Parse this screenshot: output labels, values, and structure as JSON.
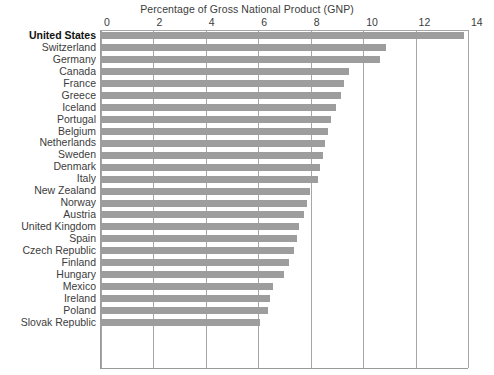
{
  "chart_data": {
    "type": "bar",
    "orientation": "horizontal",
    "title": "Percentage of Gross National Product (GNP)",
    "xlabel": "Percentage of Gross National Product (GNP)",
    "ylabel": "",
    "xlim": [
      0,
      14
    ],
    "xticks": [
      0,
      2,
      4,
      6,
      8,
      10,
      12,
      14
    ],
    "tick_labels": [
      "0",
      "2",
      "4",
      "6",
      "8",
      "10",
      "12",
      "14"
    ],
    "grid": true,
    "legend": false,
    "highlight_category": "United States",
    "bar_color": "#9d9d9d",
    "grid_color": "#a6a6a6",
    "categories": [
      "United States",
      "Switzerland",
      "Germany",
      "Canada",
      "France",
      "Greece",
      "Iceland",
      "Portugal",
      "Belgium",
      "Netherlands",
      "Sweden",
      "Denmark",
      "Italy",
      "New Zealand",
      "Norway",
      "Austria",
      "United Kingdom",
      "Spain",
      "Czech Republic",
      "Finland",
      "Hungary",
      "Mexico",
      "Ireland",
      "Poland",
      "Slovak Republic"
    ],
    "values": [
      13.9,
      10.9,
      10.7,
      9.5,
      9.3,
      9.2,
      9.0,
      8.8,
      8.7,
      8.6,
      8.5,
      8.4,
      8.3,
      8.0,
      7.9,
      7.8,
      7.6,
      7.5,
      7.4,
      7.2,
      7.0,
      6.6,
      6.5,
      6.4,
      6.1
    ]
  }
}
